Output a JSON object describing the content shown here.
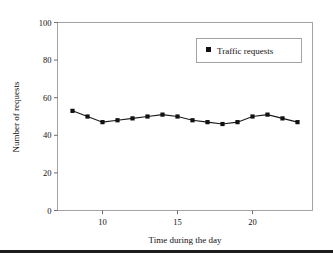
{
  "chart_data": {
    "type": "line",
    "title": "",
    "xlabel": "Time during the day",
    "ylabel": "Number of requests",
    "xlim": [
      7,
      24
    ],
    "ylim": [
      0,
      100
    ],
    "grid": false,
    "legend_position": "top-right",
    "x": [
      8,
      9,
      10,
      11,
      12,
      13,
      14,
      15,
      16,
      17,
      18,
      19,
      20,
      21,
      22,
      23
    ],
    "xtick_values": [
      10,
      15,
      20
    ],
    "xtick_labels": [
      "10",
      "15",
      "20"
    ],
    "ytick_values": [
      0,
      20,
      40,
      60,
      80,
      100
    ],
    "ytick_labels": [
      "0",
      "20",
      "40",
      "60",
      "80",
      "100"
    ],
    "series": [
      {
        "name": "Traffic requests",
        "marker": "square",
        "color": "#111111",
        "values": [
          53,
          50,
          47,
          48,
          49,
          50,
          51,
          50,
          48,
          47,
          46,
          47,
          50,
          51,
          49,
          47
        ]
      }
    ]
  },
  "legend": {
    "entries": [
      {
        "label": "Traffic requests",
        "marker_icon": "square-marker-icon"
      }
    ]
  },
  "axes": {
    "x_title": "Time during the day",
    "y_title": "Number of requests"
  },
  "colors": {
    "series": "#111111",
    "border": "#9a9a9a",
    "text": "#111111",
    "rule": "#1d1d1d",
    "background": "#ffffff"
  }
}
